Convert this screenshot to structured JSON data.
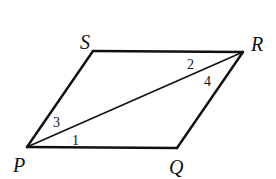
{
  "diagram": {
    "type": "parallelogram-with-diagonal",
    "vertices": [
      {
        "id": "S",
        "label": "S",
        "x": 93,
        "y": 51,
        "label_x": 80,
        "label_y": 49
      },
      {
        "id": "R",
        "label": "R",
        "x": 243,
        "y": 52,
        "label_x": 251,
        "label_y": 51
      },
      {
        "id": "P",
        "label": "P",
        "x": 27,
        "y": 147,
        "label_x": 13,
        "label_y": 172
      },
      {
        "id": "Q",
        "label": "Q",
        "x": 177,
        "y": 148,
        "label_x": 169,
        "label_y": 174
      }
    ],
    "edges": [
      {
        "from": "P",
        "to": "S"
      },
      {
        "from": "S",
        "to": "R"
      },
      {
        "from": "R",
        "to": "Q"
      },
      {
        "from": "Q",
        "to": "P"
      }
    ],
    "diagonal": {
      "from": "P",
      "to": "R"
    },
    "angle_labels": [
      {
        "label": "1",
        "x": 72,
        "y": 145
      },
      {
        "label": "2",
        "x": 187,
        "y": 69
      },
      {
        "label": "3",
        "x": 53,
        "y": 127
      },
      {
        "label": "4",
        "x": 204,
        "y": 86
      }
    ],
    "stroke_color": "#111111",
    "background": "#ffffff"
  }
}
